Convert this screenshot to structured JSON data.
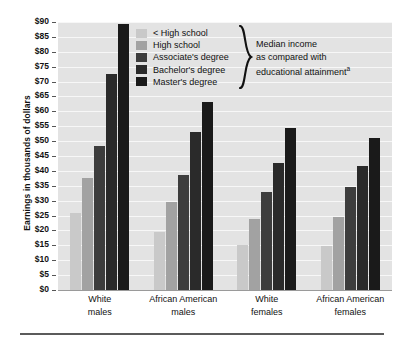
{
  "chart_data": {
    "type": "bar",
    "title": "",
    "xlabel": "",
    "ylabel": "Earnings in thousands of dollars",
    "ylim": [
      0,
      90
    ],
    "ytick_step": 5,
    "ytick_labels": [
      "$90",
      "$85",
      "$80",
      "$75",
      "$70",
      "$65",
      "$60",
      "$55",
      "$50",
      "$45",
      "$40",
      "$35",
      "$30",
      "$25",
      "$20",
      "$15",
      "$10",
      "$5",
      "$0"
    ],
    "grid": true,
    "legend_position": "upper-center",
    "categories": [
      "White males",
      "African American males",
      "White females",
      "African American females"
    ],
    "category_lines": [
      [
        "White",
        "males"
      ],
      [
        "African American",
        "males"
      ],
      [
        "White",
        "females"
      ],
      [
        "African American",
        "females"
      ]
    ],
    "series": [
      {
        "name": "< High school",
        "color": "#c9c9c9",
        "values": [
          26.0,
          19.5,
          15.0,
          14.8
        ]
      },
      {
        "name": "High school",
        "color": "#a2a2a2",
        "values": [
          37.5,
          29.5,
          24.0,
          24.5
        ]
      },
      {
        "name": "Associate's degree",
        "color": "#3d3d3d",
        "values": [
          48.5,
          38.5,
          33.0,
          34.5
        ]
      },
      {
        "name": "Bachelor's degree",
        "color": "#2a2a2a",
        "values": [
          72.5,
          53.0,
          42.5,
          41.5
        ]
      },
      {
        "name": "Master's degree",
        "color": "#1a1a1a",
        "values": [
          89.5,
          63.0,
          54.5,
          51.0
        ]
      }
    ],
    "annotation": {
      "lines": [
        "Median income",
        "as compared with",
        "educational attainment"
      ],
      "footnote_marker": "a"
    }
  }
}
